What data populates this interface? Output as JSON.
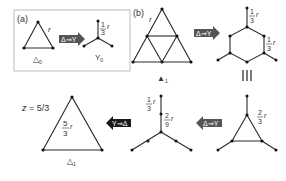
{
  "panel_a": {
    "label": "(a)",
    "triangle_caption_main": "△",
    "triangle_caption_sub": "0",
    "edge_label": "r",
    "arrow_label": "Δ⇒Y",
    "star_num": "1",
    "star_den": "3",
    "star_var": "r",
    "star_caption_main": "Y",
    "star_caption_sub": "0"
  },
  "panel_b": {
    "label": "(b)",
    "edge_label": "r",
    "caption_main": "▲",
    "caption_sub": "1",
    "arrow_label": "Δ⇒Y",
    "hex_top_num": "1",
    "hex_top_den": "3",
    "hex_top_var": "r",
    "hex_side_num": "1",
    "hex_side_den": "3",
    "hex_side_var": "r",
    "equiv_symbol": "|||"
  },
  "bottom_row": {
    "small_triangle_num": "2",
    "small_triangle_den": "3",
    "small_triangle_var": "r",
    "arrow_left_label": "Δ⇒Y",
    "star_upper_num": "1",
    "star_upper_den": "3",
    "star_upper_var": "r",
    "star_lower_num": "2",
    "star_lower_den": "9",
    "star_lower_var": "r",
    "arrow_yd_label": "Y⇒Δ",
    "z_label": "z = 5/3",
    "final_num": "5",
    "final_den": "3",
    "final_var": "r",
    "final_caption_main": "△",
    "final_caption_sub": "1"
  },
  "colors": {
    "line": "#2a2a2a",
    "arrow_fill": "#555555",
    "arrow_fill_dark": "#1a1a1a",
    "box_border": "#bbbbbb"
  }
}
